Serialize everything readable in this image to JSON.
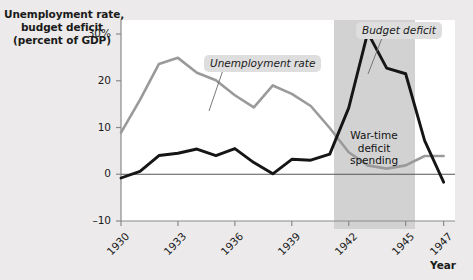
{
  "figure": {
    "background": "#eceaea",
    "plot_background": "#ffffff",
    "shade_color": "#d2d2d2",
    "unemployment_color": "#9a9a9a",
    "deficit_color": "#151515"
  },
  "axis": {
    "y_title_line1": "Unemployment rate,",
    "y_title_line2": "budget deficit",
    "y_title_line3": "(percent of GDP)",
    "x_axis_name": "Year",
    "y_ticks": [
      "30%",
      "20",
      "10",
      "0",
      "–10"
    ],
    "y_tick_values": [
      30,
      20,
      10,
      0,
      -10
    ],
    "x_ticks": [
      "1930",
      "1933",
      "1936",
      "1939",
      "1942",
      "1945",
      "1947"
    ],
    "x_tick_values": [
      1930,
      1933,
      1936,
      1939,
      1942,
      1945,
      1947
    ]
  },
  "annotations": {
    "unemployment_label": "Unemployment rate",
    "deficit_label": "Budget deficit",
    "wartime_line1": "War-time",
    "wartime_line2": "deficit",
    "wartime_line3": "spending",
    "shaded_span": [
      1941.5,
      1945.3
    ]
  },
  "chart_data": {
    "type": "line",
    "title": "",
    "xlabel": "Year",
    "ylabel": "Unemployment rate, budget deficit (percent of GDP)",
    "xlim": [
      1930,
      1947.6
    ],
    "ylim": [
      -10,
      33
    ],
    "grid": false,
    "legend": "inline-callouts",
    "x": [
      1930,
      1931,
      1932,
      1933,
      1934,
      1935,
      1936,
      1937,
      1938,
      1939,
      1940,
      1941,
      1942,
      1943,
      1944,
      1945,
      1946,
      1947
    ],
    "series": [
      {
        "name": "Unemployment rate",
        "color": "#9a9a9a",
        "values": [
          8.9,
          15.9,
          23.6,
          24.9,
          21.7,
          20.1,
          16.9,
          14.3,
          19.0,
          17.2,
          14.6,
          9.9,
          4.7,
          1.9,
          1.2,
          1.9,
          3.9,
          3.9
        ]
      },
      {
        "name": "Budget deficit",
        "color": "#151515",
        "values": [
          -0.8,
          0.6,
          4.0,
          4.5,
          5.4,
          4.0,
          5.5,
          2.5,
          0.1,
          3.2,
          3.0,
          4.3,
          14.2,
          30.3,
          22.7,
          21.5,
          7.2,
          -1.7
        ]
      }
    ]
  }
}
